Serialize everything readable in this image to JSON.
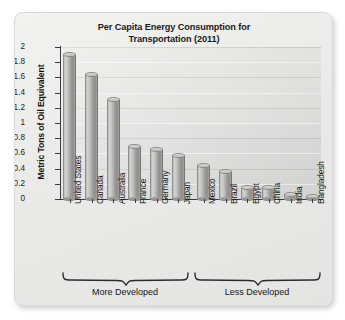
{
  "chart_data": {
    "type": "bar",
    "title": "Per Capita Energy Consumption for Transportation (2011)",
    "title_line1": "Per Capita Energy Consumption for",
    "title_line2": "Transportation (2011)",
    "xlabel": "",
    "ylabel": "Metric Tons of Oil Equivalent",
    "ylim": [
      0,
      2
    ],
    "grid": true,
    "legend": "none",
    "categories": [
      "United States",
      "Canada",
      "Australia",
      "France",
      "Germany",
      "Japan",
      "Mexico",
      "Brazil",
      "Egypt",
      "China",
      "India",
      "Bangladesh"
    ],
    "values": [
      1.9,
      1.63,
      1.3,
      0.68,
      0.65,
      0.57,
      0.44,
      0.36,
      0.14,
      0.14,
      0.05,
      0.02
    ],
    "ytick_labels": [
      "0",
      "0.2",
      "0.4",
      "0.6",
      "0.8",
      "1",
      "1.2",
      "1.4",
      "1.6",
      "1.8",
      "2"
    ],
    "ytick_values": [
      0,
      0.2,
      0.4,
      0.6,
      0.8,
      1,
      1.2,
      1.4,
      1.6,
      1.8,
      2
    ],
    "groups": [
      {
        "label": "More Developed",
        "categories": [
          "United States",
          "Canada",
          "Australia",
          "France",
          "Germany",
          "Japan"
        ]
      },
      {
        "label": "Less Developed",
        "categories": [
          "Mexico",
          "Brazil",
          "Egypt",
          "China",
          "India",
          "Bangladesh"
        ]
      }
    ],
    "colors": {
      "bar_light": "#d2d2d0",
      "bar_dark": "#8d8d8b",
      "plot_background": "#e3e3e1",
      "card_background": "#ececeb",
      "axis": "#3a3a3a",
      "text": "#141414"
    }
  }
}
